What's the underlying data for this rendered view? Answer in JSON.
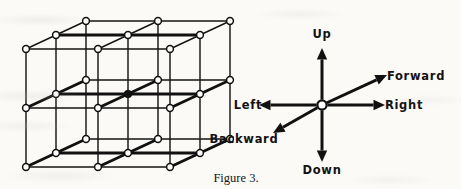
{
  "figure": {
    "caption": "Figure 3.",
    "background_color": "#fbfaf7",
    "ink_color": "#111111"
  },
  "lattice": {
    "name": "cube-lattice",
    "description": "2 by 2 by 2 isometric cube lattice with circular nodes at vertices",
    "cells_x": 2,
    "cells_y": 2,
    "cells_z": 2,
    "node_count": 27,
    "node_radius": 3.4,
    "projection": {
      "origin_x": 26,
      "origin_y": 167,
      "step_right_x": 72,
      "step_right_y": 0,
      "step_up_x": 0,
      "step_up_y": -59,
      "step_back_x": 30,
      "step_back_y": -14
    }
  },
  "axes": {
    "name": "direction-axes",
    "origin": {
      "x": 322,
      "y": 105,
      "radius": 4.6
    },
    "arrows": [
      {
        "id": "up",
        "label": "Up",
        "dx": 0,
        "dy": -57,
        "label_x": 322,
        "label_y": 38,
        "anchor": "middle"
      },
      {
        "id": "down",
        "label": "Down",
        "dx": 0,
        "dy": 57,
        "label_x": 322,
        "label_y": 174,
        "anchor": "middle"
      },
      {
        "id": "left",
        "label": "Left",
        "dx": -63,
        "dy": 0,
        "label_x": 248,
        "label_y": 109,
        "anchor": "middle"
      },
      {
        "id": "right",
        "label": "Right",
        "dx": 63,
        "dy": 0,
        "label_x": 404,
        "label_y": 109,
        "anchor": "middle"
      },
      {
        "id": "forward",
        "label": "Forward",
        "dx": 65,
        "dy": -30,
        "label_x": 416,
        "label_y": 80,
        "anchor": "middle"
      },
      {
        "id": "backward",
        "label": "Backward",
        "dx": -49,
        "dy": 28,
        "label_x": 244,
        "label_y": 143,
        "anchor": "middle"
      }
    ]
  },
  "caption": {
    "text": "Figure 3.",
    "x": 236,
    "y": 182
  }
}
